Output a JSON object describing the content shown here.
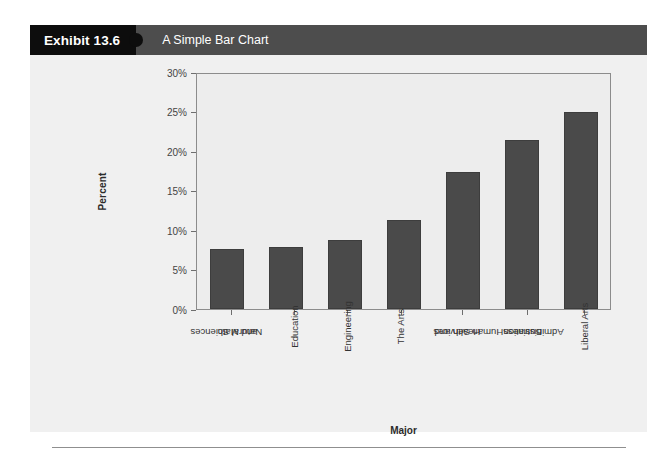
{
  "exhibit": {
    "number_label": "Exhibit 13.6",
    "title": "A Simple Bar Chart"
  },
  "colors": {
    "header_black": "#0d0d0d",
    "header_gray": "#4d4d4d",
    "bar_fill": "#4a4a4a",
    "card_background": "#f0f0f0",
    "plot_background": "#ededed",
    "axis_line": "#8c8c8c"
  },
  "chart_data": {
    "type": "bar",
    "title": "A Simple Bar Chart",
    "xlabel": "Major",
    "ylabel": "Percent",
    "categories": [
      "Natural Sciences and Math",
      "Education",
      "Engineering",
      "The Arts",
      "Health and Human Services",
      "Business Administration",
      "Liberal Arts"
    ],
    "category_lines": [
      [
        "Natural Sciences",
        "and Math"
      ],
      [
        "Education",
        ""
      ],
      [
        "Engineering",
        ""
      ],
      [
        "The Arts",
        ""
      ],
      [
        "Health and",
        "Human Services"
      ],
      [
        "Business",
        "Administration"
      ],
      [
        "Liberal Arts",
        ""
      ]
    ],
    "values": [
      7.6,
      7.8,
      8.7,
      11.3,
      17.4,
      21.4,
      25.0
    ],
    "ylim": [
      0,
      30
    ],
    "ytick_values": [
      0,
      5,
      10,
      15,
      20,
      25,
      30
    ],
    "ytick_labels": [
      "0%",
      "5%",
      "10%",
      "15%",
      "20%",
      "25%",
      "30%"
    ],
    "grid": false,
    "legend": false
  }
}
